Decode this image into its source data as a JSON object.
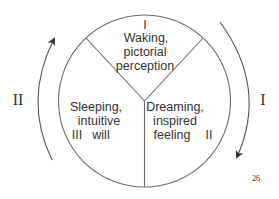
{
  "diagram": {
    "segments": [
      {
        "numeral": "I",
        "lines": [
          "Waking,",
          "pictorial",
          "perception"
        ]
      },
      {
        "numeral": "II",
        "lines": [
          "Dreaming,",
          "inspired",
          "feeling"
        ]
      },
      {
        "numeral": "III",
        "lines": [
          "Sleeping,",
          "intuitive",
          "will"
        ]
      }
    ],
    "outer_labels": {
      "left": "II",
      "right": "I"
    },
    "page_number": "26",
    "colors": {
      "line": "#6a6a6a",
      "text": "#333333",
      "background": "#ffffff"
    }
  }
}
